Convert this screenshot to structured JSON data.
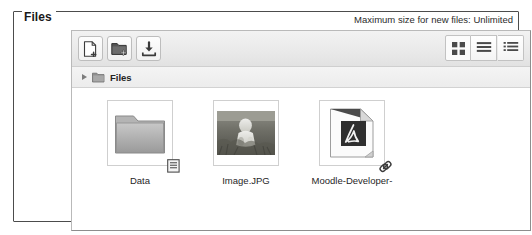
{
  "fieldset": {
    "legend": "Files"
  },
  "maxsize": {
    "note": "Maximum size for new files: Unlimited"
  },
  "toolbar": {
    "buttons": [
      {
        "name": "add-file",
        "title": "Add...",
        "icon": "add-file-icon"
      },
      {
        "name": "add-folder",
        "title": "Create folder",
        "icon": "add-folder-icon"
      },
      {
        "name": "download",
        "title": "Download all",
        "icon": "download-icon"
      }
    ],
    "views": [
      {
        "name": "view-icons",
        "title": "Display folder with file icons",
        "icon": "grid-view-icon",
        "selected": true
      },
      {
        "name": "view-list",
        "title": "Display folder with file details",
        "icon": "list-view-icon",
        "selected": false
      },
      {
        "name": "view-tree",
        "title": "Display folder as file tree",
        "icon": "tree-view-icon",
        "selected": false
      }
    ]
  },
  "breadcrumb": {
    "arrow_icon": "triangle-right-icon",
    "folder_icon": "folder-icon",
    "label": "Files"
  },
  "files": [
    {
      "name": "Data",
      "type": "folder",
      "icon": "folder-icon",
      "badge": "document-badge-icon"
    },
    {
      "name": "Image.JPG",
      "type": "image",
      "icon": "photo-thumbnail",
      "badge": null
    },
    {
      "name": "Moodle-Developer-",
      "type": "pdf",
      "icon": "pdf-icon",
      "badge": "link-badge-icon"
    }
  ],
  "colors": {
    "border_dark": "#4c4c4c",
    "panel_border": "#b9b9b9",
    "toolbar_bg": "#eaeaea",
    "text": "#222222"
  }
}
